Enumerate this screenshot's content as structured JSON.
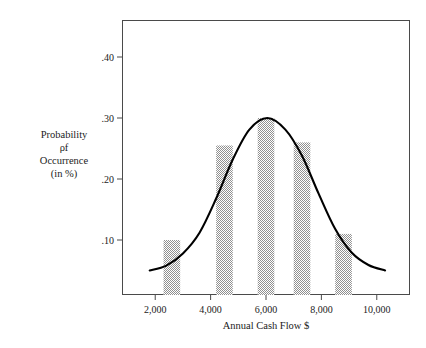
{
  "chart_data": {
    "type": "bar",
    "title": "",
    "xlabel": "Annual Cash Flow $",
    "ylabel_lines": [
      "Probability",
      "ρf",
      "Occurrence",
      "(in %)"
    ],
    "ylabel": "Probability of Occurrence (in %)",
    "xlim": [
      800,
      11200
    ],
    "ylim": [
      0,
      0.455
    ],
    "grid": false,
    "legend": null,
    "xticks": [
      2000,
      4000,
      6000,
      8000,
      10000
    ],
    "xtick_labels": [
      "2,000",
      "4,000",
      "6,000",
      "8,000",
      "10,000"
    ],
    "yticks": [
      0.1,
      0.2,
      0.3,
      0.4
    ],
    "ytick_labels": [
      ".10",
      ".20",
      ".30",
      ".40"
    ],
    "categories": [
      2600,
      4500,
      6000,
      7300,
      8800
    ],
    "values": [
      0.1,
      0.255,
      0.3,
      0.26,
      0.11
    ],
    "bar_width": 600,
    "bar_fill": "hatch-checker",
    "overlay": {
      "type": "line",
      "name": "normal-curve",
      "color": "#000000",
      "peak_x": 6050,
      "peak_y": 0.3,
      "tail_y": 0.05,
      "x": [
        1800,
        2400,
        3000,
        3600,
        4200,
        4800,
        5400,
        6050,
        6700,
        7300,
        7900,
        8500,
        9100,
        9700,
        10300
      ],
      "y": [
        0.05,
        0.058,
        0.078,
        0.112,
        0.168,
        0.232,
        0.281,
        0.3,
        0.281,
        0.238,
        0.176,
        0.118,
        0.079,
        0.059,
        0.05
      ]
    }
  },
  "colors": {
    "frame": "#4a4a4a",
    "curve": "#000000",
    "bar_pattern_dark": "#8c8c8c",
    "bar_pattern_light": "#ffffff",
    "text": "#1b1b1b",
    "background": "#ffffff"
  }
}
